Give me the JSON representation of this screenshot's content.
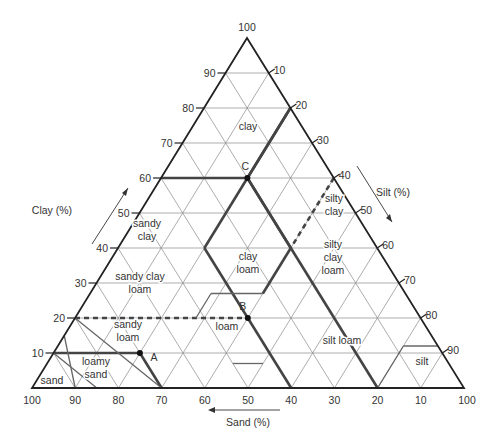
{
  "diagram": {
    "axes": {
      "clay": {
        "title": "Clay (%)",
        "ticks": [
          10,
          20,
          30,
          40,
          50,
          60,
          70,
          80,
          90,
          100
        ]
      },
      "silt": {
        "title": "Silt (%)",
        "ticks": [
          10,
          20,
          30,
          40,
          50,
          60,
          70,
          80,
          90,
          100
        ]
      },
      "sand": {
        "title": "Sand (%)",
        "ticks": [
          100,
          90,
          80,
          70,
          60,
          50,
          40,
          30,
          20,
          10
        ]
      }
    },
    "classes": [
      {
        "name": "clay",
        "lines": [
          "clay"
        ],
        "pos": [
          248,
          130
        ]
      },
      {
        "name": "sandy clay",
        "lines": [
          "sandy",
          "clay"
        ],
        "pos": [
          147,
          233
        ]
      },
      {
        "name": "silty clay",
        "lines": [
          "silty",
          "clay"
        ],
        "pos": [
          334,
          208
        ]
      },
      {
        "name": "clay loam",
        "lines": [
          "clay",
          "loam"
        ],
        "pos": [
          248,
          266
        ]
      },
      {
        "name": "silty clay loam",
        "lines": [
          "silty",
          "clay",
          "loam"
        ],
        "pos": [
          333,
          261
        ]
      },
      {
        "name": "sandy clay loam",
        "lines": [
          "sandy clay",
          "loam"
        ],
        "pos": [
          140,
          286
        ]
      },
      {
        "name": "sandy loam",
        "lines": [
          "sandy",
          "loam"
        ],
        "pos": [
          128,
          334
        ]
      },
      {
        "name": "loam",
        "lines": [
          "loam"
        ],
        "pos": [
          227,
          330
        ]
      },
      {
        "name": "silt loam",
        "lines": [
          "silt loam"
        ],
        "pos": [
          342,
          344
        ]
      },
      {
        "name": "silt",
        "lines": [
          "silt"
        ],
        "pos": [
          422,
          365
        ]
      },
      {
        "name": "loamy sand",
        "lines": [
          "loamy",
          "sand"
        ],
        "pos": [
          96,
          371
        ]
      },
      {
        "name": "sand",
        "lines": [
          "sand"
        ],
        "pos": [
          52,
          384
        ]
      }
    ],
    "points": [
      {
        "label": "A",
        "clay": 10,
        "silt": 20,
        "sand": 70
      },
      {
        "label": "B",
        "clay": 20,
        "silt": 40,
        "sand": 40
      },
      {
        "label": "C",
        "clay": 60,
        "silt": 20,
        "sand": 20
      }
    ]
  }
}
